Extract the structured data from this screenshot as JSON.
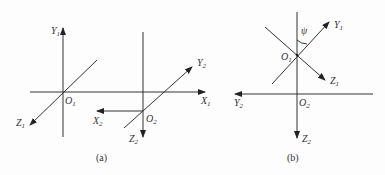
{
  "diagram": {
    "panel_a": {
      "caption": "(a)",
      "labels": {
        "Y1": {
          "main": "Y",
          "sub": "1"
        },
        "O1": {
          "main": "O",
          "sub": "1"
        },
        "Z1": {
          "main": "Z",
          "sub": "1"
        },
        "X1": {
          "main": "X",
          "sub": "1"
        },
        "Y2": {
          "main": "Y",
          "sub": "2"
        },
        "O2": {
          "main": "O",
          "sub": "2"
        },
        "X2": {
          "main": "X",
          "sub": "2"
        },
        "Z2": {
          "main": "Z",
          "sub": "2"
        }
      }
    },
    "panel_b": {
      "caption": "(b)",
      "angle": "ψ",
      "labels": {
        "Y1": {
          "main": "Y",
          "sub": "1"
        },
        "O1": {
          "main": "O",
          "sub": "1"
        },
        "Z1": {
          "main": "Z",
          "sub": "1"
        },
        "Y2": {
          "main": "Y",
          "sub": "2"
        },
        "O2": {
          "main": "O",
          "sub": "2"
        },
        "Z2": {
          "main": "Z",
          "sub": "2"
        }
      }
    }
  }
}
